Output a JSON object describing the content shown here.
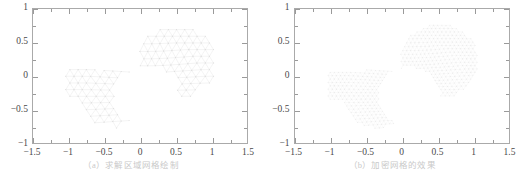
{
  "figure": {
    "panels": [
      {
        "id": "panel-a",
        "caption": "（a）求解区域网格绘制",
        "axes": {
          "xlabel": "",
          "ylabel": "",
          "xlim": [
            -1.5,
            1.5
          ],
          "ylim": [
            -1.0,
            1.0
          ],
          "xticks": [
            "-1.5",
            "-1",
            "-0.5",
            "0",
            "0.5",
            "1",
            "1.5"
          ],
          "xtick_values": [
            -1.5,
            -1,
            -0.5,
            0,
            0.5,
            1,
            1.5
          ],
          "yticks": [
            "1",
            "0.5",
            "0",
            "-0.5",
            "-1"
          ],
          "ytick_values": [
            1,
            0.5,
            0,
            -0.5,
            -1
          ],
          "x_minor_values": [
            -1.25,
            -0.75,
            -0.25,
            0.25,
            0.75,
            1.25
          ],
          "y_minor_values": [
            0.75,
            0.25,
            -0.25,
            -0.75
          ],
          "grid": false,
          "frame_color": "#aaaaaa",
          "tick_color": "#9a9a9a",
          "label_color": "#4a4a4a"
        },
        "mesh": {
          "type": "triangular-mesh",
          "density": "coarse",
          "cell_size": 0.115,
          "line_color": "#e2e2e2",
          "line_width": 0.4,
          "node_color": "#d8d8d8",
          "node_radius": 0.5
        }
      },
      {
        "id": "panel-b",
        "caption": "（b）加密网格的效果",
        "axes": {
          "xlabel": "",
          "ylabel": "",
          "xlim": [
            -1.5,
            1.5
          ],
          "ylim": [
            -1.0,
            1.0
          ],
          "xticks": [
            "-1.5",
            "-1",
            "-0.5",
            "0",
            "0.5",
            "1",
            "1.5"
          ],
          "xtick_values": [
            -1.5,
            -1,
            -0.5,
            0,
            0.5,
            1,
            1.5
          ],
          "yticks": [
            "1",
            "0.5",
            "0",
            "-0.5",
            "-1"
          ],
          "ytick_values": [
            1,
            0.5,
            0,
            -0.5,
            -1
          ],
          "x_minor_values": [
            -1.25,
            -0.75,
            -0.25,
            0.25,
            0.75,
            1.25
          ],
          "y_minor_values": [
            0.75,
            0.25,
            -0.25,
            -0.75
          ],
          "grid": false,
          "frame_color": "#aaaaaa",
          "tick_color": "#9a9a9a",
          "label_color": "#4a4a4a"
        },
        "mesh": {
          "type": "triangular-mesh",
          "density": "refined",
          "cell_size": 0.058,
          "line_color": "#ededed",
          "line_width": 0.3,
          "node_color": "#e0e0e0",
          "node_radius": 0.35
        }
      }
    ],
    "domain": {
      "description": "L-shaped-with-circular-notch region",
      "rect_left": [
        -1.06,
        -0.36,
        0.48,
        0.46
      ],
      "lower_lobe_center": [
        -0.36,
        -0.33
      ],
      "lower_lobe_radius": 0.46,
      "upper_lobe_center": [
        0.52,
        0.22
      ],
      "upper_lobe_radius": 0.56,
      "notch_center": [
        0.1,
        -0.3
      ],
      "notch_radius": 0.42
    }
  },
  "chart_data": {
    "type": "scatter",
    "title": "",
    "subtitle": "",
    "xlabel": "",
    "ylabel": "",
    "xlim": [
      -1.5,
      1.5
    ],
    "ylim": [
      -1.0,
      1.0
    ],
    "grid": false,
    "legend": null,
    "series": [
      {
        "name": "（a）求解区域网格绘制",
        "kind": "triangular-mesh",
        "nominal_cell_size": 0.115,
        "xticks": [
          -1.5,
          -1,
          -0.5,
          0,
          0.5,
          1,
          1.5
        ],
        "yticks": [
          1,
          0.5,
          0,
          -0.5,
          -1
        ]
      },
      {
        "name": "（b）加密网格的效果",
        "kind": "triangular-mesh",
        "nominal_cell_size": 0.058,
        "xticks": [
          -1.5,
          -1,
          -0.5,
          0,
          0.5,
          1,
          1.5
        ],
        "yticks": [
          1,
          0.5,
          0,
          -0.5,
          -1
        ]
      }
    ]
  }
}
